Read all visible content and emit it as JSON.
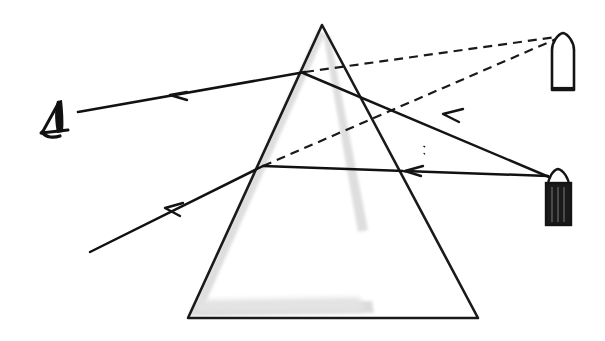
{
  "figure": {
    "title": "Optical ray diagram: refraction of two light rays through a triangular glass prism toward an observing eye",
    "background_color": "#ffffff",
    "width": 605,
    "height": 341
  },
  "colors": {
    "ink": "#111111",
    "stroke": "#1a1a1a",
    "shadow_gray": "#d9d9d9",
    "shadow_gray_light": "#e6e6e6",
    "candle_dark_body": "#1a1a1a",
    "candle_light_body": "#ffffff",
    "dashed_ray": "#1a1a1a"
  },
  "prism": {
    "name": "triangular-prism",
    "apex": [
      322,
      25
    ],
    "bottom_left": [
      188,
      318
    ],
    "bottom_right": [
      478,
      318
    ],
    "stroke_width": 2.6,
    "fill": "none",
    "shadow_offset": [
      -6,
      4
    ]
  },
  "observer": {
    "name": "eye-observer",
    "label": "",
    "position": [
      54,
      117
    ],
    "width": 26,
    "height": 38
  },
  "sources": [
    {
      "name": "candle-light-top",
      "style": "outline",
      "body_fill": "#ffffff",
      "tip": [
        563,
        35
      ],
      "body_x": 551,
      "body_y": 44,
      "body_w": 24,
      "body_h": 47
    },
    {
      "name": "candle-dark-bottom",
      "style": "filled",
      "body_fill": "#1a1a1a",
      "tip": [
        557,
        170
      ],
      "body_x": 545,
      "body_y": 180,
      "body_w": 25,
      "body_h": 45
    }
  ],
  "rays": [
    {
      "name": "ray-upper-incident",
      "type": "solid",
      "from": [
        563,
        40
      ],
      "to": [
        305,
        72
      ],
      "description": "incident ray from upper candle to upper face entry point",
      "arrow": null
    },
    {
      "name": "ray-upper-refracted-exit",
      "type": "solid",
      "from": [
        305,
        72
      ],
      "to": [
        78,
        112
      ],
      "description": "refracted ray leaving prism toward the eye",
      "arrow": {
        "at": [
          178,
          94
        ],
        "direction": "left"
      }
    },
    {
      "name": "ray-upper-inside",
      "type": "solid",
      "from": [
        563,
        40
      ],
      "to": [
        305,
        72
      ],
      "description": "path segment inside prism for upper ray"
    },
    {
      "name": "ray-lower-incident",
      "type": "solid",
      "from": [
        548,
        176
      ],
      "to": [
        263,
        166
      ],
      "description": "incident ray from lower dark candle to lower entry point",
      "arrow": {
        "at": [
          412,
          150
        ],
        "direction": "left"
      }
    },
    {
      "name": "ray-lower-refracted-exit",
      "type": "solid",
      "from": [
        263,
        166
      ],
      "to": [
        90,
        252
      ],
      "description": "refracted ray leaving prism lower-left",
      "arrow": {
        "at": [
          172,
          212
        ],
        "direction": "left"
      }
    },
    {
      "name": "ray-cross-incident",
      "type": "solid",
      "from": [
        548,
        176
      ],
      "to": [
        305,
        72
      ],
      "description": "second incident ray travelling up-left into prism",
      "arrow": {
        "at": [
          450,
          115
        ],
        "direction": "upper-left"
      }
    }
  ],
  "virtual_rays": [
    {
      "name": "virtual-ray-upper-dashed",
      "type": "dashed",
      "from": [
        305,
        72
      ],
      "to": [
        563,
        36
      ],
      "dash_pattern": "9 6",
      "description": "dashed construction line from upper refraction point to candle"
    },
    {
      "name": "virtual-ray-lower-dashed",
      "type": "dashed",
      "from": [
        263,
        166
      ],
      "to": [
        563,
        36
      ],
      "dash_pattern": "9 6",
      "description": "dashed construction line from lower refraction point to candle"
    }
  ],
  "arrowheads": {
    "count": 4,
    "style": "open-barbed",
    "direction_note": "all arrowheads point in the direction of light propagation (toward the left / toward the eye)"
  },
  "shadow": {
    "name": "prism-drop-shadow",
    "color": "#dcdcdc",
    "regions": [
      "left-edge",
      "bottom-edge",
      "inner-right-edge"
    ]
  }
}
